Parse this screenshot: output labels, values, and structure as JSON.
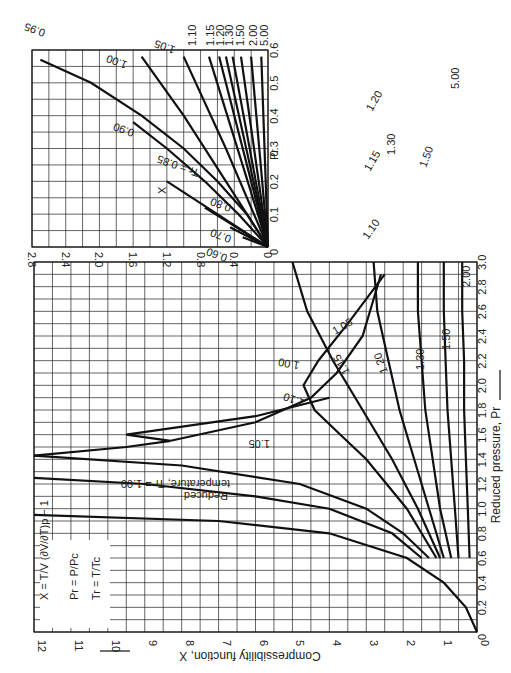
{
  "chart_data": [
    {
      "type": "line",
      "title": "Compressibility function X vs reduced pressure",
      "xlabel": "Reduced pressure, Pr",
      "ylabel": "Compressibility function, X",
      "xlim": [
        0,
        3.0
      ],
      "ylim": [
        0,
        12
      ],
      "xticks": [
        "0",
        "0.2",
        "0.4",
        "0.6",
        "0.8",
        "1.0",
        "1.2",
        "1.4",
        "1.6",
        "1.8",
        "2.0",
        "2.2",
        "2.4",
        "2.6",
        "2.8",
        "3.0"
      ],
      "yticks": [
        "0",
        "1",
        "2",
        "3",
        "4",
        "5",
        "6",
        "7",
        "8",
        "9",
        "10",
        "11",
        "12"
      ],
      "grid": true,
      "legend_note": "Reduced temperature, Tr = 1.00",
      "formulas": [
        "X = (T/V)(∂V/∂T)p − 1",
        "Pr = P / Pc",
        "Tr = T / Tc"
      ],
      "series": [
        {
          "name": "1.00",
          "x": [
            0,
            0.2,
            0.4,
            0.6,
            0.8,
            0.9,
            0.95
          ],
          "y": [
            0,
            0.3,
            0.9,
            1.9,
            4.0,
            7.0,
            12
          ]
        },
        {
          "name": "1.05",
          "x": [
            0.6,
            0.8,
            1.0,
            1.1,
            1.2,
            1.25
          ],
          "y": [
            1.5,
            2.3,
            4.0,
            6.0,
            9.0,
            12
          ]
        },
        {
          "name": "1.10",
          "x": [
            0.6,
            0.8,
            1.0,
            1.2,
            1.35,
            1.43
          ],
          "y": [
            1.3,
            2.0,
            3.0,
            4.8,
            8.0,
            12
          ]
        },
        {
          "name": "1.00 (loop)",
          "x": [
            1.43,
            1.5,
            1.55,
            1.6,
            1.75,
            1.9
          ],
          "y": [
            12,
            9.5,
            8.3,
            9.5,
            6.0,
            4.0
          ]
        },
        {
          "name": "1.05 (upper)",
          "x": [
            1.55,
            1.7,
            1.9,
            2.1,
            2.4,
            2.9
          ],
          "y": [
            8.3,
            6.0,
            4.5,
            3.8,
            3.1,
            2.6
          ]
        },
        {
          "name": "1.15",
          "x": [
            0.6,
            1.0,
            1.4,
            1.6,
            1.8,
            2.0,
            2.2,
            2.5,
            2.9
          ],
          "y": [
            1.1,
            1.9,
            3.0,
            3.7,
            4.4,
            4.7,
            4.3,
            3.5,
            2.5
          ]
        },
        {
          "name": "1.20",
          "x": [
            0.6,
            1.0,
            1.4,
            1.8,
            2.2,
            2.6,
            3.0
          ],
          "y": [
            1.0,
            1.6,
            2.3,
            3.1,
            3.9,
            4.6,
            5.0
          ]
        },
        {
          "name": "1.30",
          "x": [
            0.6,
            1.0,
            1.4,
            1.8,
            2.2,
            2.6,
            3.0
          ],
          "y": [
            0.9,
            1.3,
            1.7,
            2.1,
            2.4,
            2.7,
            2.8
          ]
        },
        {
          "name": "1.50",
          "x": [
            0.6,
            1.0,
            1.4,
            1.8,
            2.2,
            2.6,
            3.0
          ],
          "y": [
            0.7,
            1.0,
            1.2,
            1.4,
            1.5,
            1.6,
            1.6
          ]
        },
        {
          "name": "2.00",
          "x": [
            0.6,
            1.0,
            1.4,
            1.8,
            2.2,
            2.6,
            3.0
          ],
          "y": [
            0.5,
            0.6,
            0.7,
            0.8,
            0.85,
            0.9,
            0.9
          ]
        },
        {
          "name": "5.00",
          "x": [
            0.6,
            1.0,
            1.4,
            1.8,
            2.2,
            2.6,
            3.0
          ],
          "y": [
            0.2,
            0.25,
            0.3,
            0.35,
            0.35,
            0.4,
            0.4
          ]
        }
      ]
    },
    {
      "type": "line",
      "title": "Inset: low pressure region",
      "xlabel": "Pr",
      "ylabel": "X",
      "xlim": [
        0,
        0.6
      ],
      "ylim": [
        0,
        2.8
      ],
      "xticks": [
        "0",
        "0.1",
        "0.2",
        "0.3",
        "0.4",
        "0.5",
        "0.6"
      ],
      "yticks": [
        "0",
        "0.4",
        "0.8",
        "1.2",
        "1.6",
        "2.0",
        "2.4",
        "2.8"
      ],
      "grid": true,
      "series": [
        {
          "name": "Tr = 0.60",
          "x": [
            0,
            0.03
          ],
          "y": [
            0,
            0.3
          ]
        },
        {
          "name": "0.70",
          "x": [
            0,
            0.06
          ],
          "y": [
            0,
            0.45
          ]
        },
        {
          "name": "0.80",
          "x": [
            0,
            0.12
          ],
          "y": [
            0,
            0.75
          ]
        },
        {
          "name": "0.85",
          "x": [
            0,
            0.2
          ],
          "y": [
            0,
            1.2
          ]
        },
        {
          "name": "0.90",
          "x": [
            0,
            0.1,
            0.2,
            0.3,
            0.38
          ],
          "y": [
            0,
            0.35,
            0.75,
            1.2,
            1.6
          ]
        },
        {
          "name": "0.95",
          "x": [
            0,
            0.1,
            0.2,
            0.3,
            0.4,
            0.5,
            0.57
          ],
          "y": [
            0,
            0.25,
            0.6,
            1.0,
            1.5,
            2.1,
            2.7
          ]
        },
        {
          "name": "1.00",
          "x": [
            0,
            0.2,
            0.4,
            0.58
          ],
          "y": [
            0,
            0.5,
            1.0,
            1.5
          ]
        },
        {
          "name": "1.05",
          "x": [
            0,
            0.3,
            0.58
          ],
          "y": [
            0,
            0.5,
            1.0
          ]
        },
        {
          "name": "1.10",
          "x": [
            0,
            0.58
          ],
          "y": [
            0,
            0.7
          ]
        },
        {
          "name": "1.15",
          "x": [
            0,
            0.58
          ],
          "y": [
            0,
            0.58
          ]
        },
        {
          "name": "1.20",
          "x": [
            0,
            0.58
          ],
          "y": [
            0,
            0.5
          ]
        },
        {
          "name": "1.30",
          "x": [
            0,
            0.58
          ],
          "y": [
            0,
            0.42
          ]
        },
        {
          "name": "1.50",
          "x": [
            0,
            0.58
          ],
          "y": [
            0,
            0.32
          ]
        },
        {
          "name": "2.00",
          "x": [
            0,
            0.58
          ],
          "y": [
            0,
            0.2
          ]
        },
        {
          "name": "5.00",
          "x": [
            0,
            0.58
          ],
          "y": [
            0,
            0.08
          ]
        }
      ]
    }
  ],
  "labels": {
    "ylabel": "Compressibility function, X",
    "xlabel": "Reduced pressure, Pr",
    "inset_x": "X",
    "inset_pr": "Pr",
    "formula1": "X = T/V (∂V/∂T)p − 1",
    "formula2": "Pr = P/Pc",
    "formula3": "Tr = T/Tc",
    "note1": "Reduced",
    "note2": "temperature, Tr = 1.00",
    "c105": "1.05",
    "c110": "1.10",
    "c100": "1.00",
    "c105b": "1.05",
    "c115": "1.15",
    "c120": "1.20",
    "c130": "1.30",
    "c150": "1.50",
    "c200": "2.00",
    "c500": "5.00",
    "c110b": "1.10",
    "c115b": "1.15",
    "c120b": "1.20",
    "c130b": "1.30",
    "c150b": "1.50",
    "i060": "0.60",
    "i070": "0.70",
    "i080": "0.80",
    "i085": "Tr = 0.85",
    "i090": "0.90",
    "i095": "0.95",
    "i100": "1.00",
    "i105": "1.05",
    "i110": "1.10",
    "i115": "1.15",
    "i120": "1.20",
    "i130": "1.30",
    "i150": "1.50",
    "i200": "2.00",
    "i500": "5.00"
  }
}
